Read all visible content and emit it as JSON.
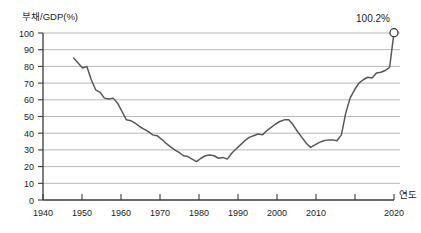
{
  "chart_data": {
    "type": "line",
    "title": "",
    "ylabel": "부채/GDP(%)",
    "xlabel": "연도",
    "ylim": [
      0,
      100
    ],
    "xlim": [
      1940,
      2020
    ],
    "grid": true,
    "legend": null,
    "y_ticks": [
      "0",
      "10",
      "20",
      "30",
      "40",
      "50",
      "60",
      "70",
      "80",
      "90",
      "100"
    ],
    "x_ticks": [
      "1940",
      "1950",
      "1960",
      "1970",
      "1980",
      "1990",
      "2000",
      "2010",
      "2020"
    ],
    "annotation": {
      "text": "100.2%",
      "x": 2020,
      "y": 100.2
    },
    "series": [
      {
        "name": "부채/GDP",
        "x": [
          1947,
          1948,
          1949,
          1950,
          1951,
          1952,
          1953,
          1954,
          1955,
          1956,
          1957,
          1958,
          1959,
          1960,
          1961,
          1962,
          1963,
          1964,
          1965,
          1966,
          1967,
          1968,
          1969,
          1970,
          1971,
          1972,
          1973,
          1974,
          1975,
          1976,
          1977,
          1978,
          1979,
          1980,
          1981,
          1982,
          1983,
          1984,
          1985,
          1986,
          1987,
          1988,
          1989,
          1990,
          1991,
          1992,
          1993,
          1994,
          1995,
          1996,
          1997,
          1998,
          1999,
          2000,
          2001,
          2002,
          2003,
          2004,
          2005,
          2006,
          2007,
          2008,
          2009,
          2010,
          2011,
          2012,
          2013,
          2014,
          2015,
          2016,
          2017,
          2018,
          2019,
          2020
        ],
        "values": [
          85.0,
          82.0,
          79.0,
          80.0,
          72.0,
          66.0,
          64.5,
          61.0,
          60.5,
          61.0,
          58.0,
          53.0,
          48.0,
          47.5,
          46.0,
          44.0,
          42.5,
          41.0,
          39.0,
          38.5,
          36.5,
          34.0,
          32.0,
          30.0,
          28.5,
          26.5,
          26.0,
          24.5,
          23.0,
          25.0,
          26.5,
          27.0,
          26.5,
          25.0,
          25.5,
          24.5,
          28.0,
          30.5,
          33.0,
          35.5,
          37.5,
          38.5,
          39.5,
          39.0,
          41.5,
          43.5,
          45.5,
          47.0,
          48.0,
          48.0,
          45.0,
          41.0,
          37.5,
          34.0,
          31.5,
          33.0,
          34.5,
          35.5,
          36.0,
          36.0,
          35.5,
          39.0,
          52.0,
          61.0,
          66.0,
          70.0,
          72.0,
          73.5,
          73.0,
          76.0,
          76.5,
          77.5,
          79.5,
          100.2
        ]
      }
    ]
  },
  "axes": {
    "y_axis_title": "부채/GDP(%)",
    "x_axis_title": "연도"
  }
}
